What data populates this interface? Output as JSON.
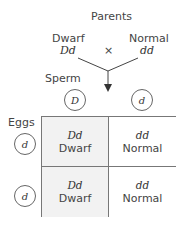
{
  "title": "Parents",
  "parents": [
    {
      "phenotype": "Dwarf",
      "genotype": "Dd"
    },
    {
      "phenotype": "Normal",
      "genotype": "dd"
    }
  ],
  "cross_symbol": "×",
  "sperm_label": "Sperm",
  "eggs_label": "Eggs",
  "sperm_alleles": [
    "D",
    "d"
  ],
  "egg_alleles": [
    "d",
    "d"
  ],
  "cells": [
    {
      "genotype": "Dd",
      "phenotype": "Dwarf",
      "fill": "#f2f2f2"
    },
    {
      "genotype": "dd",
      "phenotype": "Normal",
      "fill": "#ffffff"
    },
    {
      "genotype": "Dd",
      "phenotype": "Dwarf",
      "fill": "#f2f2f2"
    },
    {
      "genotype": "dd",
      "phenotype": "Normal",
      "fill": "#ffffff"
    }
  ]
}
